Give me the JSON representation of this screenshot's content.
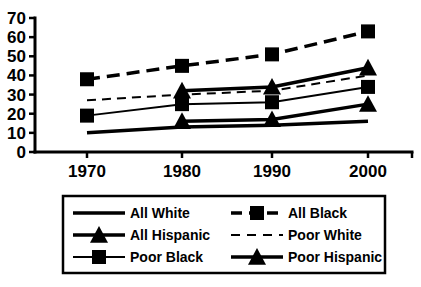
{
  "chart_data": {
    "type": "line",
    "title": "",
    "subtitle": "",
    "xlabel": "",
    "ylabel": "",
    "categories": [
      "1970",
      "1980",
      "1990",
      "2000"
    ],
    "x": [
      1970,
      1980,
      1990,
      2000
    ],
    "ylim": [
      0,
      70
    ],
    "yticks": [
      0,
      10,
      20,
      30,
      40,
      50,
      60,
      70
    ],
    "grid": false,
    "legend_position": "bottom",
    "series": [
      {
        "name": "All White",
        "values": [
          10,
          13,
          14,
          16
        ],
        "marker": "none",
        "dash": "solid",
        "width": 3.5,
        "color": "#000000"
      },
      {
        "name": "All Black",
        "values": [
          38,
          45,
          51,
          63
        ],
        "marker": "square",
        "dash": "dashed",
        "width": 3.5,
        "color": "#000000"
      },
      {
        "name": "All Hispanic",
        "values": [
          null,
          16,
          17,
          25
        ],
        "marker": "triangle",
        "dash": "solid",
        "width": 3.5,
        "color": "#000000"
      },
      {
        "name": "Poor White",
        "values": [
          27,
          30,
          32,
          40
        ],
        "marker": "none",
        "dash": "dashed-thin",
        "width": 2,
        "color": "#000000"
      },
      {
        "name": "Poor Black",
        "values": [
          19,
          25,
          26,
          34
        ],
        "marker": "square",
        "dash": "solid",
        "width": 2,
        "color": "#000000"
      },
      {
        "name": "Poor Hispanic",
        "values": [
          null,
          32,
          34,
          44
        ],
        "marker": "triangle",
        "dash": "solid",
        "width": 3.5,
        "color": "#000000"
      }
    ]
  },
  "legend": {
    "entries": [
      {
        "label": "All White",
        "series": 0,
        "row": 0,
        "col": 0
      },
      {
        "label": "All  Black",
        "series": 1,
        "row": 0,
        "col": 1
      },
      {
        "label": "All  Hispanic",
        "series": 2,
        "row": 1,
        "col": 0
      },
      {
        "label": "Poor White",
        "series": 3,
        "row": 1,
        "col": 1
      },
      {
        "label": "Poor  Black",
        "series": 4,
        "row": 2,
        "col": 0
      },
      {
        "label": "Poor  Hispanic",
        "series": 5,
        "row": 2,
        "col": 1
      }
    ]
  },
  "colors": {
    "ink": "#000000",
    "background": "#ffffff"
  }
}
